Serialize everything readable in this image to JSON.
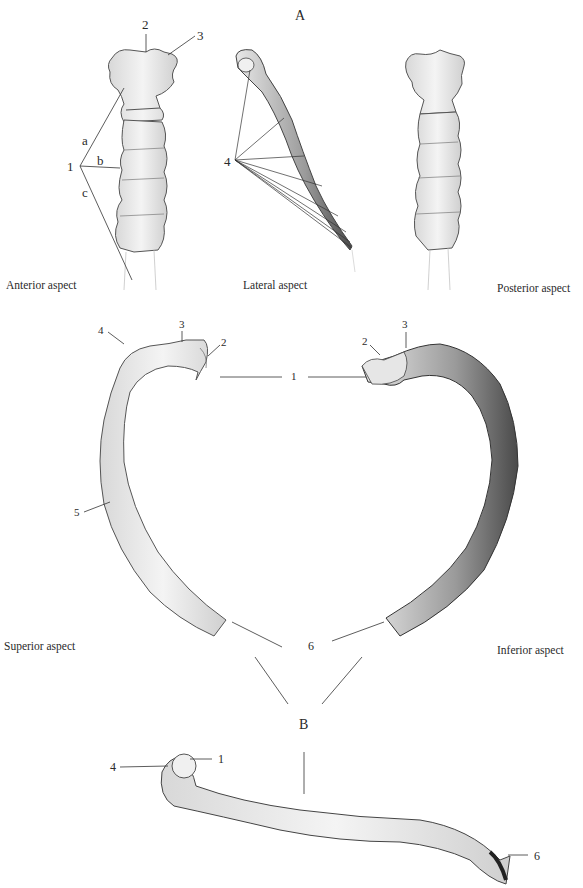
{
  "figure": {
    "panel_a": {
      "letter": "A",
      "views": [
        {
          "caption": "Anterior aspect"
        },
        {
          "caption": "Lateral aspect"
        },
        {
          "caption": "Posterior aspect"
        }
      ],
      "labels": {
        "one": "1",
        "two": "2",
        "three": "3",
        "four": "4",
        "a": "a",
        "b": "b",
        "c": "c"
      }
    },
    "panel_b": {
      "letter": "B",
      "views": [
        {
          "caption": "Superior aspect"
        },
        {
          "caption": "Inferior aspect"
        }
      ],
      "labels": {
        "one": "1",
        "two": "2",
        "three": "3",
        "four": "4",
        "five": "5",
        "six": "6"
      }
    }
  }
}
